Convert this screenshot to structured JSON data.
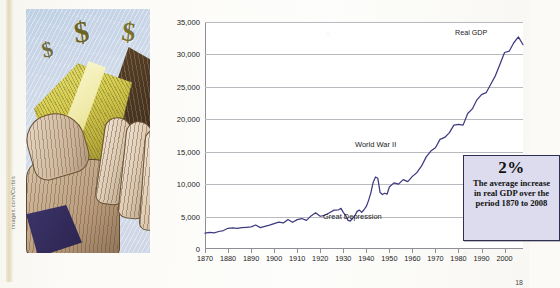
{
  "figure": {
    "credit": "images.com/Corbis",
    "illustration_alt": "hand holding gold wedge with dollar signs",
    "page_number": "18"
  },
  "callout": {
    "percent": "2%",
    "body": "The average increase in real GDP over the period 1870 to 2008",
    "bg_color": "#dcdcee",
    "border_color": "#2e2e52"
  },
  "chart_data": {
    "type": "line",
    "title": "",
    "xlabel": "",
    "ylabel": "Real Per Capita GDP (1990 dollars)",
    "series_name": "Real GDP",
    "line_color": "#3d3a80",
    "grid": true,
    "legend_position": "inline-label",
    "xlim": [
      1870,
      2008
    ],
    "ylim": [
      0,
      35000
    ],
    "ytick_labels": [
      "0",
      "5,000",
      "10,000",
      "15,000",
      "20,000",
      "25,000",
      "30,000",
      "35,000"
    ],
    "yticks": [
      0,
      5000,
      10000,
      15000,
      20000,
      25000,
      30000,
      35000
    ],
    "xtick_labels": [
      "1870",
      "1880",
      "1890",
      "1900",
      "1910",
      "1920",
      "1930",
      "1940",
      "1950",
      "1960",
      "1970",
      "1980",
      "1990",
      "2000"
    ],
    "xticks": [
      1870,
      1880,
      1890,
      1900,
      1910,
      1920,
      1930,
      1940,
      1950,
      1960,
      1970,
      1980,
      1990,
      2000
    ],
    "annotations": [
      {
        "label": "Real GDP",
        "x": 2004,
        "y": 32500
      },
      {
        "label": "World War II",
        "x": 1944,
        "y": 16500
      },
      {
        "label": "Great Depression",
        "x": 1934,
        "y": 4200
      }
    ],
    "x": [
      1870,
      1872,
      1874,
      1876,
      1878,
      1880,
      1882,
      1884,
      1886,
      1888,
      1890,
      1892,
      1894,
      1896,
      1898,
      1900,
      1902,
      1904,
      1906,
      1908,
      1910,
      1912,
      1914,
      1916,
      1918,
      1920,
      1922,
      1924,
      1926,
      1928,
      1929,
      1930,
      1931,
      1932,
      1933,
      1934,
      1935,
      1936,
      1937,
      1938,
      1939,
      1940,
      1941,
      1942,
      1943,
      1944,
      1945,
      1946,
      1947,
      1948,
      1949,
      1950,
      1952,
      1954,
      1956,
      1958,
      1960,
      1962,
      1964,
      1966,
      1968,
      1970,
      1972,
      1974,
      1976,
      1978,
      1980,
      1982,
      1984,
      1986,
      1988,
      1990,
      1992,
      1994,
      1996,
      1998,
      2000,
      2002,
      2004,
      2006,
      2008
    ],
    "y": [
      2445,
      2560,
      2480,
      2700,
      2850,
      3190,
      3250,
      3180,
      3290,
      3350,
      3400,
      3700,
      3300,
      3480,
      3670,
      3920,
      4150,
      4020,
      4550,
      4120,
      4530,
      4700,
      4420,
      5100,
      5580,
      5050,
      5200,
      5600,
      6000,
      6050,
      6260,
      5650,
      5200,
      4450,
      4300,
      4700,
      5100,
      5800,
      6000,
      5650,
      6050,
      6560,
      7500,
      8700,
      10300,
      11100,
      10900,
      8700,
      8400,
      8600,
      8450,
      9560,
      10200,
      10000,
      10700,
      10400,
      11200,
      11800,
      12800,
      14200,
      15100,
      15600,
      16900,
      17200,
      17900,
      19100,
      19200,
      19100,
      20900,
      21600,
      23000,
      23800,
      24100,
      25400,
      26700,
      28500,
      30300,
      30500,
      31800,
      32700,
      31500
    ]
  }
}
